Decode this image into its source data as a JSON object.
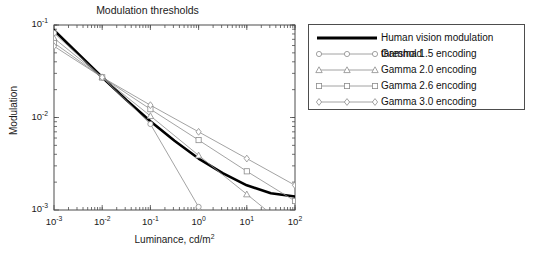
{
  "chart_data": {
    "type": "line",
    "title": "Modulation thresholds",
    "xlabel": "Luminance, cd/m2",
    "xlabel_base": "Luminance, cd/m",
    "xlabel_exp": "2",
    "ylabel": "Modulation",
    "xscale": "log",
    "yscale": "log",
    "xlim": [
      0.001,
      100
    ],
    "ylim": [
      0.001,
      0.1
    ],
    "grid": false,
    "legend_position": "outside right",
    "xticks": [
      {
        "value": 0.001,
        "base": "10",
        "exp": "-3"
      },
      {
        "value": 0.01,
        "base": "10",
        "exp": "-2"
      },
      {
        "value": 0.1,
        "base": "10",
        "exp": "-1"
      },
      {
        "value": 1,
        "base": "10",
        "exp": "0"
      },
      {
        "value": 10,
        "base": "10",
        "exp": "1"
      },
      {
        "value": 100,
        "base": "10",
        "exp": "2"
      }
    ],
    "yticks": [
      {
        "value": 0.1,
        "base": "10",
        "exp": "-1"
      },
      {
        "value": 0.01,
        "base": "10",
        "exp": "-2"
      },
      {
        "value": 0.001,
        "base": "10",
        "exp": "-3"
      }
    ],
    "series": [
      {
        "name": "Human vision modulation threshold",
        "marker": "none",
        "color": "#000000",
        "width": 2.6,
        "x": [
          0.001,
          0.00316,
          0.01,
          0.0316,
          0.1,
          0.316,
          1,
          3.16,
          10,
          31.6,
          100
        ],
        "y": [
          0.088,
          0.049,
          0.0272,
          0.0155,
          0.0091,
          0.0056,
          0.0036,
          0.0025,
          0.00185,
          0.00152,
          0.0014
        ]
      },
      {
        "name": "Gamma 1.5 encoding",
        "marker": "circle",
        "color": "#8c8c8c",
        "width": 0.8,
        "x": [
          0.001,
          0.01,
          0.1,
          1,
          10
        ],
        "y": [
          0.082,
          0.0272,
          0.0085,
          0.00108,
          0.000345
        ]
      },
      {
        "name": "Gamma 2.0 encoding",
        "marker": "triangle",
        "color": "#8c8c8c",
        "width": 0.8,
        "x": [
          0.001,
          0.01,
          0.1,
          1,
          10,
          100
        ],
        "y": [
          0.072,
          0.0272,
          0.0104,
          0.0039,
          0.00148,
          0.00056
        ]
      },
      {
        "name": "Gamma 2.6 encoding",
        "marker": "square",
        "color": "#8c8c8c",
        "width": 0.8,
        "x": [
          0.001,
          0.01,
          0.1,
          1,
          10,
          100
        ],
        "y": [
          0.064,
          0.0272,
          0.0123,
          0.0057,
          0.00262,
          0.00125
        ]
      },
      {
        "name": "Gamma 3.0 encoding",
        "marker": "diamond",
        "color": "#8c8c8c",
        "width": 0.8,
        "x": [
          0.001,
          0.01,
          0.1,
          1,
          10,
          100
        ],
        "y": [
          0.059,
          0.0272,
          0.0136,
          0.007,
          0.0036,
          0.00185
        ]
      }
    ]
  },
  "legend": {
    "entries": [
      {
        "label": "Human vision modulation threshold"
      },
      {
        "label": "Gamma 1.5 encoding"
      },
      {
        "label": "Gamma 2.0 encoding"
      },
      {
        "label": "Gamma 2.6 encoding"
      },
      {
        "label": "Gamma 3.0 encoding"
      }
    ]
  }
}
